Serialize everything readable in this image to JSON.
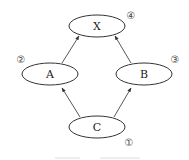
{
  "diagram": {
    "type": "directed-graph",
    "nodes": [
      {
        "id": "X",
        "label": "X",
        "order": "④",
        "cx": 97,
        "cy": 26,
        "rx": 28,
        "ry": 11,
        "order_x": 131,
        "order_y": 15
      },
      {
        "id": "A",
        "label": "A",
        "order": "②",
        "cx": 50,
        "cy": 74,
        "rx": 28,
        "ry": 11,
        "order_x": 21,
        "order_y": 59
      },
      {
        "id": "B",
        "label": "B",
        "order": "③",
        "cx": 144,
        "cy": 74,
        "rx": 28,
        "ry": 11,
        "order_x": 175,
        "order_y": 59
      },
      {
        "id": "C",
        "label": "C",
        "order": "①",
        "cx": 97,
        "cy": 127,
        "rx": 28,
        "ry": 11,
        "order_x": 129,
        "order_y": 142
      }
    ],
    "edges": [
      {
        "from": "C",
        "to": "A"
      },
      {
        "from": "C",
        "to": "B"
      },
      {
        "from": "A",
        "to": "X"
      },
      {
        "from": "B",
        "to": "X"
      }
    ],
    "colors": {
      "stroke": "#333333",
      "text": "#222222",
      "background": "#ffffff"
    }
  }
}
